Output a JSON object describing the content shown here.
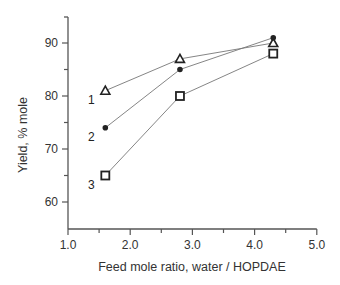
{
  "chart_data": {
    "type": "line",
    "title": "",
    "xlabel": "Feed mole ratio, water / HOPDAE",
    "ylabel": "Yield, % mole",
    "xlim": [
      1.0,
      5.0
    ],
    "ylim": [
      55,
      95
    ],
    "xticks": [
      "1.0",
      "2.0",
      "3.0",
      "4.0",
      "5.0"
    ],
    "yticks": [
      "60",
      "70",
      "80",
      "90"
    ],
    "grid": false,
    "legend": "inline numeric labels near first points",
    "series": [
      {
        "name": "1",
        "marker": "triangle-open",
        "x": [
          1.6,
          2.8,
          4.3
        ],
        "y": [
          81,
          87,
          90
        ]
      },
      {
        "name": "2",
        "marker": "circle-filled",
        "x": [
          1.6,
          2.8,
          4.3
        ],
        "y": [
          74,
          85,
          91
        ]
      },
      {
        "name": "3",
        "marker": "square-open",
        "x": [
          1.6,
          2.8,
          4.3
        ],
        "y": [
          65,
          80,
          88
        ]
      }
    ]
  }
}
